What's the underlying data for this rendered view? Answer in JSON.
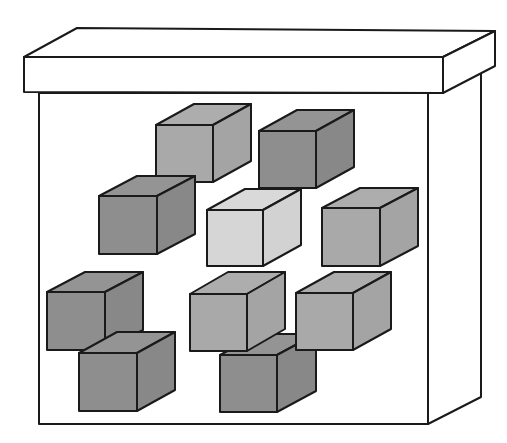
{
  "diagram": {
    "colors": {
      "outline": "#1a1a1a",
      "box_fill": "#ffffff",
      "dark": {
        "front": "#8e8e8e",
        "top": "#949494",
        "side": "#888888"
      },
      "medium": {
        "front": "#a9a9a9",
        "top": "#adadad",
        "side": "#a4a4a4"
      },
      "light": {
        "front": "#d6d6d6",
        "top": "#d9d9d9",
        "side": "#d2d2d2"
      }
    },
    "box": {
      "lid": {
        "front": [
          24,
          57,
          443,
          93
        ],
        "depth": [
          52,
          -26
        ]
      },
      "body": {
        "left": 39,
        "right": 428,
        "top": 93,
        "bottom": 424,
        "depth": [
          53,
          -27
        ]
      }
    },
    "cubes": [
      {
        "id": "cube-top-center",
        "shade": "medium",
        "x": 156,
        "y": 125,
        "size": 57,
        "dx": 38,
        "dy": -21
      },
      {
        "id": "cube-top-right",
        "shade": "dark",
        "x": 259,
        "y": 131,
        "size": 57,
        "dx": 38,
        "dy": -21
      },
      {
        "id": "cube-mid-left",
        "shade": "dark",
        "x": 99,
        "y": 196,
        "size": 58,
        "dx": 38,
        "dy": -20
      },
      {
        "id": "cube-mid-center",
        "shade": "light",
        "x": 207,
        "y": 210,
        "size": 56,
        "dx": 38,
        "dy": -21
      },
      {
        "id": "cube-mid-right",
        "shade": "medium",
        "x": 322,
        "y": 208,
        "size": 58,
        "dx": 38,
        "dy": -20
      },
      {
        "id": "cube-low-left-upper",
        "shade": "dark",
        "x": 47,
        "y": 292,
        "size": 58,
        "dx": 38,
        "dy": -20
      },
      {
        "id": "cube-low-left-lower",
        "shade": "dark",
        "x": 79,
        "y": 353,
        "size": 58,
        "dx": 38,
        "dy": -21
      },
      {
        "id": "cube-low-center-lower",
        "shade": "dark",
        "x": 220,
        "y": 355,
        "size": 57,
        "dx": 39,
        "dy": -21
      },
      {
        "id": "cube-low-center-upper",
        "shade": "medium",
        "x": 190,
        "y": 294,
        "size": 57,
        "dx": 38,
        "dy": -22
      },
      {
        "id": "cube-low-right",
        "shade": "medium",
        "x": 296,
        "y": 293,
        "size": 57,
        "dx": 38,
        "dy": -21
      }
    ]
  }
}
